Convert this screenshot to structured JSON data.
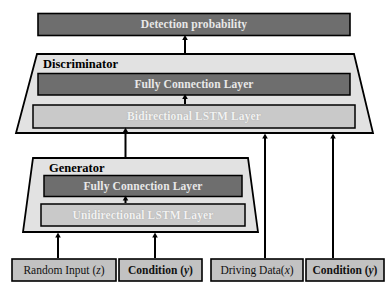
{
  "diagram": {
    "colors": {
      "dark_block": "#6e6e6e",
      "light_block": "#c9c9c9",
      "container_fill": "#e2e2e2",
      "input_fill": "#c2c2c2",
      "outline": "#000000",
      "dark_text": "#ffffff",
      "body_text": "#000000",
      "background": "#ffffff"
    },
    "output": {
      "label": "Detection probability",
      "name": "detection-probability-block"
    },
    "discriminator": {
      "title": "Discriminator",
      "layers": [
        {
          "label": "Fully Connection Layer",
          "style": "dark"
        },
        {
          "label": "Bidirectional LSTM Layer",
          "style": "light"
        }
      ]
    },
    "generator": {
      "title": "Generator",
      "layers": [
        {
          "label": "Fully Connection Layer",
          "style": "dark"
        },
        {
          "label": "Unidirectional LSTM Layer",
          "style": "light"
        }
      ]
    },
    "inputs": [
      {
        "label": "Random Input (z)",
        "bold": false
      },
      {
        "label": "Condition (y)",
        "bold": true
      },
      {
        "label": "Driving Data(x)",
        "bold": false
      },
      {
        "label": "Condition (y)",
        "bold": true
      }
    ],
    "arrows": [
      {
        "name": "discriminator-to-output",
        "from": "Fully Connection Layer (Discriminator)",
        "to": "Detection probability"
      },
      {
        "name": "bilstm-to-fc-discriminator",
        "from": "Bidirectional LSTM Layer",
        "to": "Fully Connection Layer"
      },
      {
        "name": "generator-to-discriminator",
        "from": "Generator",
        "to": "Bidirectional LSTM Layer"
      },
      {
        "name": "unilstm-to-fc-generator",
        "from": "Unidirectional LSTM Layer",
        "to": "Fully Connection Layer"
      },
      {
        "name": "random-input-to-generator",
        "from": "Random Input (z)",
        "to": "Generator"
      },
      {
        "name": "condition-to-generator",
        "from": "Condition (y)",
        "to": "Generator"
      },
      {
        "name": "driving-data-to-discriminator",
        "from": "Driving Data(x)",
        "to": "Discriminator"
      },
      {
        "name": "condition-to-discriminator",
        "from": "Condition (y)",
        "to": "Discriminator"
      }
    ]
  }
}
